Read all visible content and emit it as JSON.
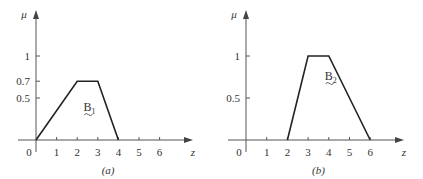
{
  "chart_data": [
    {
      "type": "line",
      "panel_label": "(a)",
      "ylabel": "μ",
      "xlabel": "z",
      "xlim": [
        0,
        6.8
      ],
      "ylim": [
        0,
        1.18
      ],
      "xticks": [
        1,
        2,
        3,
        4,
        5,
        6
      ],
      "xtick_labels": [
        "1",
        "2",
        "3",
        "4",
        "5",
        "6"
      ],
      "origin_label": "0",
      "yticks": [
        0.5,
        0.7,
        1
      ],
      "ytick_labels": [
        "0.5",
        "0.7",
        "1"
      ],
      "grid": false,
      "series": [
        {
          "name": "B1",
          "name_main": "B",
          "name_sub": "1",
          "x": [
            0,
            2,
            3,
            4
          ],
          "y": [
            0,
            0.7,
            0.7,
            0
          ],
          "label_pos": [
            2.3,
            0.35
          ]
        }
      ]
    },
    {
      "type": "line",
      "panel_label": "(b)",
      "ylabel": "μ",
      "xlabel": "z",
      "xlim": [
        0,
        6.8
      ],
      "ylim": [
        0,
        1.18
      ],
      "xticks": [
        1,
        2,
        3,
        4,
        5,
        6
      ],
      "xtick_labels": [
        "1",
        "2",
        "3",
        "4",
        "5",
        "6"
      ],
      "origin_label": "0",
      "yticks": [
        0.5,
        1
      ],
      "ytick_labels": [
        "0.5",
        "1"
      ],
      "grid": false,
      "series": [
        {
          "name": "B2",
          "name_main": "B",
          "name_sub": "2",
          "x": [
            2,
            3,
            4,
            6
          ],
          "y": [
            0,
            1,
            1,
            0
          ],
          "label_pos": [
            3.8,
            0.72
          ]
        }
      ]
    }
  ]
}
